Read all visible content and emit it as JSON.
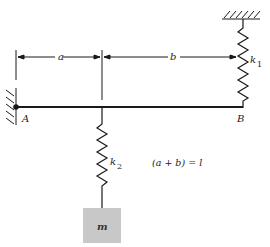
{
  "diagram": {
    "labels": {
      "dim_a": "a",
      "dim_b": "b",
      "spring_top": "k",
      "spring_top_sub": "1",
      "spring_mass": "k",
      "spring_mass_sub": "2",
      "point_a": "A",
      "point_b": "B",
      "mass": "m",
      "relation": "(a + b) = l"
    },
    "colors": {
      "line": "#1a1a1a",
      "mass_fill": "#c8c8c8"
    }
  }
}
